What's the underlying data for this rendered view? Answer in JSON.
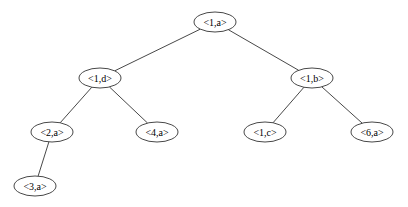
{
  "diagram": {
    "type": "tree",
    "nodes": [
      {
        "id": "n1a",
        "label": "<1,a>",
        "x": 215,
        "y": 22
      },
      {
        "id": "n1d",
        "label": "<1,d>",
        "x": 100,
        "y": 78
      },
      {
        "id": "n1b",
        "label": "<1,b>",
        "x": 312,
        "y": 78
      },
      {
        "id": "n2a",
        "label": "<2,a>",
        "x": 52,
        "y": 132
      },
      {
        "id": "n4a",
        "label": "<4,a>",
        "x": 157,
        "y": 132
      },
      {
        "id": "n1c",
        "label": "<1,c>",
        "x": 265,
        "y": 132
      },
      {
        "id": "n6a",
        "label": "<6,a>",
        "x": 372,
        "y": 132
      },
      {
        "id": "n3a",
        "label": "<3,a>",
        "x": 35,
        "y": 186
      }
    ],
    "edges": [
      {
        "from": "n1a",
        "to": "n1d"
      },
      {
        "from": "n1a",
        "to": "n1b"
      },
      {
        "from": "n1d",
        "to": "n2a"
      },
      {
        "from": "n1d",
        "to": "n4a"
      },
      {
        "from": "n1b",
        "to": "n1c"
      },
      {
        "from": "n1b",
        "to": "n6a"
      },
      {
        "from": "n2a",
        "to": "n3a"
      }
    ]
  }
}
